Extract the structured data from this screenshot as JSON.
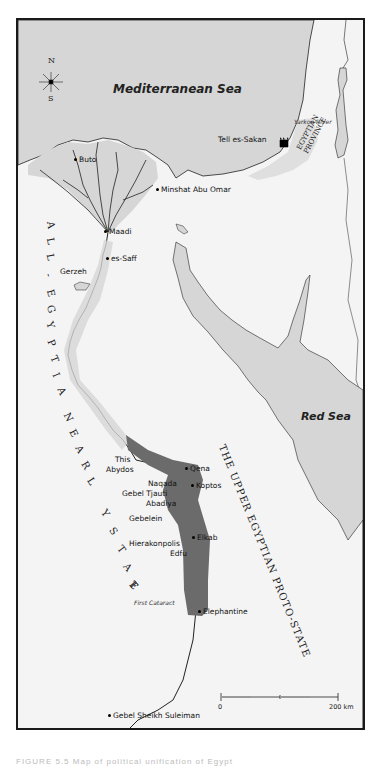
{
  "map": {
    "seas": {
      "mediterranean": "Mediterranean Sea",
      "red": "Red Sea"
    },
    "compass": {
      "north": "N",
      "south": "S"
    },
    "regions": {
      "early_state_letters": [
        "A",
        "L",
        "L",
        "-",
        "E",
        "G",
        "Y",
        "P",
        "T",
        "I",
        "A",
        "N",
        "E",
        "A",
        "R",
        "L",
        "Y",
        "S",
        "T",
        "A",
        "T",
        "E"
      ],
      "proto_state": "THE UPPER EGYPTIAN PROTO-STATE",
      "egyptian_province_line1": "EGYPTIAN",
      "egyptian_province_line2": "PROVINCE"
    },
    "features": {
      "yarkon_river": "Yarkon River",
      "first_cataract": "First Cataract"
    },
    "sites": {
      "buto": "Buto",
      "minshat": "Minshat Abu Omar",
      "tell_es_sakan": "Tell es-Sakan",
      "maadi": "Maadi",
      "es_saff": "es-Saff",
      "gerzeh": "Gerzeh",
      "this": "This",
      "abydos": "Abydos",
      "qena": "Qena",
      "naqada": "Naqada",
      "koptos": "Koptos",
      "gebel_tjauti": "Gebel Tjauti",
      "abadiya": "Abadiya",
      "gebelein": "Gebelein",
      "elkab": "Elkab",
      "hierakonpolis": "Hierakonpolis",
      "edfu": "Edfu",
      "elephantine": "Elephantine",
      "gebel_sheikh_suleiman": "Gebel Sheikh Suleiman"
    },
    "scale": {
      "start": "0",
      "end": "200 km"
    },
    "colors": {
      "sea": "#d6d6d6",
      "land": "#f4f4f4",
      "proto_state": "#6b6b6b",
      "border": "#1a1a1a"
    }
  },
  "caption": "FIGURE 5.5 Map of political unification of Egypt"
}
